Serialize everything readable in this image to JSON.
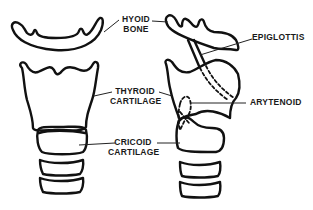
{
  "diagram": {
    "colors": {
      "line": "#111111",
      "background": "#ffffff",
      "text": "#1a1a1a"
    },
    "labels": {
      "hyoid": {
        "line1": "HYOID",
        "line2": "BONE"
      },
      "thyroid": {
        "line1": "THYROID",
        "line2": "CARTILAGE"
      },
      "cricoid": {
        "line1": "CRICOID",
        "line2": "CARTILAGE"
      },
      "epiglottis": {
        "line1": "EPIGLOTTIS"
      },
      "arytenoid": {
        "line1": "ARYTENOID"
      }
    },
    "views": [
      {
        "name": "anterior-view",
        "parts": [
          "hyoid-bone",
          "thyroid-cartilage",
          "cricoid-cartilage",
          "tracheal-ring",
          "tracheal-ring"
        ]
      },
      {
        "name": "lateral-view",
        "parts": [
          "epiglottis",
          "thyroid-cartilage",
          "arytenoid",
          "cricoid-cartilage",
          "tracheal-ring",
          "tracheal-ring"
        ]
      }
    ]
  }
}
